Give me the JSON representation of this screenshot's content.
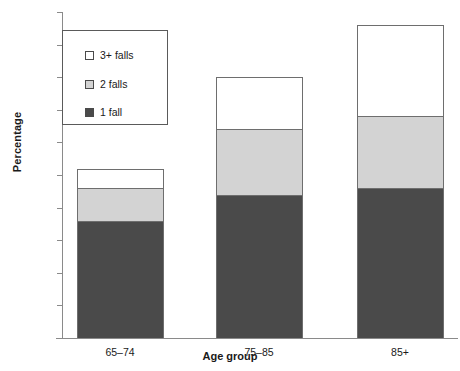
{
  "chart_data": {
    "type": "bar",
    "stacked": true,
    "title": "",
    "xlabel": "Age group",
    "ylabel": "Percentage",
    "categories": [
      "65–74",
      "75–85",
      "85+"
    ],
    "series": [
      {
        "name": "1 fall",
        "values": [
          18,
          22,
          23
        ],
        "color": "#4a4a4a"
      },
      {
        "name": "2 falls",
        "values": [
          5,
          10,
          11
        ],
        "color": "#d3d3d3"
      },
      {
        "name": "3+ falls",
        "values": [
          3,
          8,
          14
        ],
        "color": "#ffffff"
      }
    ],
    "cumulative_tops": [
      [
        18,
        23,
        26
      ],
      [
        22,
        32,
        40
      ],
      [
        23,
        34,
        48
      ]
    ],
    "totals": [
      26,
      40,
      48
    ],
    "ylim": [
      0,
      50
    ],
    "yticks": [
      0,
      5,
      10,
      15,
      20,
      25,
      30,
      35,
      40,
      45,
      50
    ],
    "ytick_labels": [
      "0",
      "5",
      "10",
      "15",
      "20",
      "25",
      "30",
      "35",
      "40",
      "45",
      "50"
    ],
    "grid": false,
    "legend_position": "upper-left",
    "legend_entries": [
      "3+ falls",
      "2 falls",
      "1 fall"
    ]
  },
  "axes": {
    "y_title": "Percentage",
    "x_title": "Age group"
  },
  "colors": {
    "segment_1_fall": "#4a4a4a",
    "segment_2_falls": "#d3d3d3",
    "segment_3plus_falls": "#ffffff",
    "axis": "#8a8a8a",
    "outline": "#6e6e6e",
    "background": "#ffffff"
  }
}
